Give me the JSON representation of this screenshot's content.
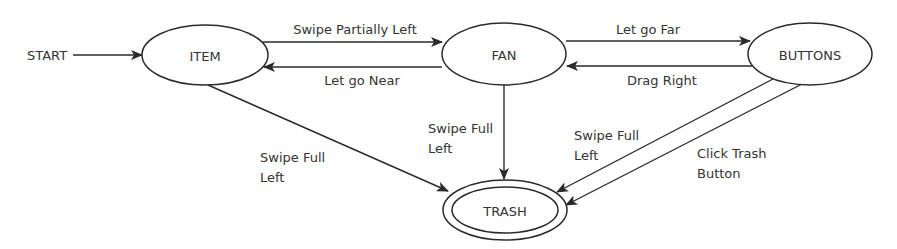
{
  "diagram": {
    "type": "state-machine",
    "colors": {
      "stroke": "#2a2a2a",
      "text": "#333333",
      "background": "#ffffff"
    },
    "start": {
      "label": "START"
    },
    "nodes": {
      "item": {
        "label": "ITEM"
      },
      "fan": {
        "label": "FAN"
      },
      "buttons": {
        "label": "BUTTONS"
      },
      "trash": {
        "label": "TRASH",
        "final": true
      }
    },
    "edges": {
      "start_item": {
        "from": "START",
        "to": "ITEM",
        "label": ""
      },
      "item_fan": {
        "from": "ITEM",
        "to": "FAN",
        "label": "Swipe Partially Left"
      },
      "fan_item": {
        "from": "FAN",
        "to": "ITEM",
        "label": "Let go Near"
      },
      "fan_buttons": {
        "from": "FAN",
        "to": "BUTTONS",
        "label": "Let go Far"
      },
      "buttons_fan": {
        "from": "BUTTONS",
        "to": "FAN",
        "label": "Drag Right"
      },
      "item_trash": {
        "from": "ITEM",
        "to": "TRASH",
        "label_line1": "Swipe Full",
        "label_line2": "Left"
      },
      "fan_trash": {
        "from": "FAN",
        "to": "TRASH",
        "label_line1": "Swipe Full",
        "label_line2": "Left"
      },
      "buttons_trash_swipe": {
        "from": "BUTTONS",
        "to": "TRASH",
        "label_line1": "Swipe Full",
        "label_line2": "Left"
      },
      "buttons_trash_click": {
        "from": "BUTTONS",
        "to": "TRASH",
        "label_line1": "Click Trash",
        "label_line2": "Button"
      }
    }
  }
}
